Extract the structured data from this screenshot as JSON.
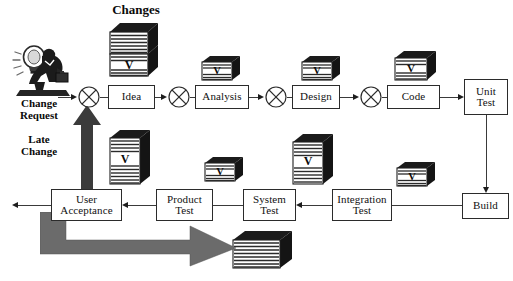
{
  "diagram": {
    "colors": {
      "line": "#3a3a3a",
      "box_border": "#2b2b2b",
      "doc_face": "#ffffff",
      "doc_stripe": "#2a2a2a",
      "doc_shadow": "#1a1a1a",
      "fat_arrow": "#6e6e6e",
      "fat_arrow_dark": "#4f4f4f",
      "background": "#ffffff"
    },
    "labels": [
      {
        "id": "changes",
        "text": "Changes"
      },
      {
        "id": "change-request",
        "text": "Change\nRequest"
      },
      {
        "id": "late-change",
        "text": "Late\nChange"
      }
    ],
    "boxes": [
      {
        "id": "idea",
        "text": "Idea"
      },
      {
        "id": "analysis",
        "text": "Analysis"
      },
      {
        "id": "design",
        "text": "Design"
      },
      {
        "id": "code",
        "text": "Code"
      },
      {
        "id": "unit-test",
        "text": "Unit\nTest"
      },
      {
        "id": "build",
        "text": "Build"
      },
      {
        "id": "integration-test",
        "text": "Integration\nTest"
      },
      {
        "id": "system-test",
        "text": "System\nTest"
      },
      {
        "id": "product-test",
        "text": "Product\nTest"
      },
      {
        "id": "user-acceptance",
        "text": "User\nAcceptance"
      }
    ],
    "junctions": [
      {
        "id": "junction-1",
        "symbol": "circle-x"
      },
      {
        "id": "junction-2",
        "symbol": "circle-x"
      },
      {
        "id": "junction-3",
        "symbol": "circle-x"
      },
      {
        "id": "junction-4",
        "symbol": "circle-x"
      }
    ],
    "documents": [
      {
        "id": "doc-changes",
        "mark": "V",
        "note": "tall double stack above Idea"
      },
      {
        "id": "doc-analysis",
        "mark": "V",
        "note": "above Analysis"
      },
      {
        "id": "doc-design",
        "mark": "V",
        "note": "above Design"
      },
      {
        "id": "doc-code",
        "mark": "V",
        "note": "above Code"
      },
      {
        "id": "doc-late-change",
        "mark": "V",
        "note": "below Idea"
      },
      {
        "id": "doc-product-test",
        "mark": "V",
        "note": "above Product Test"
      },
      {
        "id": "doc-system-test",
        "mark": "V",
        "note": "above System Test"
      },
      {
        "id": "doc-integration-test",
        "mark": "V",
        "note": "above Integration Test"
      },
      {
        "id": "doc-release",
        "mark": "",
        "note": "delivered product, bottom right"
      }
    ],
    "fat_arrows": [
      {
        "id": "late-change-arrow",
        "direction": "up",
        "note": "User Acceptance back to first junction"
      },
      {
        "id": "release-arrow",
        "direction": "down-right",
        "note": "User Acceptance to delivered product"
      }
    ],
    "mark_glyph": "V"
  }
}
